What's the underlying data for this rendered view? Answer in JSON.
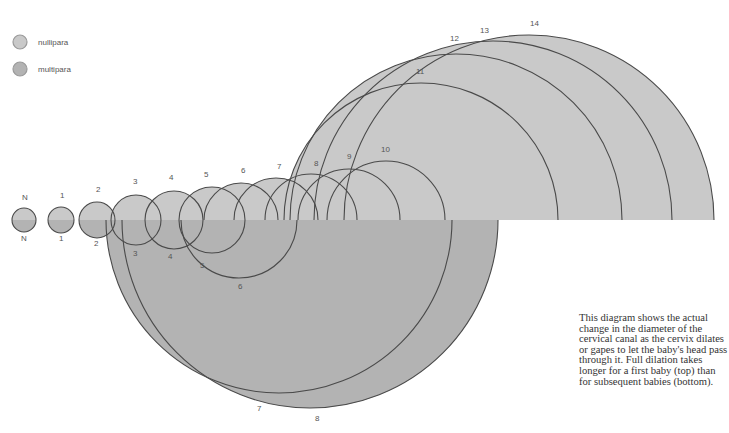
{
  "legend": [
    {
      "label": "nullipara",
      "color": "#c9c9c9",
      "cx": 20,
      "cy": 42
    },
    {
      "label": "multipara",
      "color": "#b3b3b3",
      "cx": 20,
      "cy": 69
    }
  ],
  "caption": "This diagram shows the actual change in the diameter of the cervical canal as the cervix dilates or gapes to let the baby's head pass through it. Full dilation takes longer for a first baby (top) than for subsequent babies (bottom).",
  "colors": {
    "top_fill": "#c9c9c9",
    "bottom_fill": "#b3b3b3",
    "stroke": "#4a4a4a",
    "label": "#555555"
  },
  "chart_data": {
    "type": "diagram",
    "baseline_y": 220,
    "top_series": {
      "name": "nullipara",
      "circles": [
        {
          "label": "N",
          "cx": 24,
          "r": 12,
          "lx": 22,
          "ly": 200
        },
        {
          "label": "1",
          "cx": 61,
          "r": 13,
          "lx": 60,
          "ly": 198
        },
        {
          "label": "2",
          "cx": 97,
          "r": 18,
          "lx": 96,
          "ly": 192
        },
        {
          "label": "3",
          "cx": 136,
          "r": 25,
          "lx": 133,
          "ly": 184
        },
        {
          "label": "4",
          "cx": 174,
          "r": 29,
          "lx": 169,
          "ly": 180
        },
        {
          "label": "5",
          "cx": 212,
          "r": 33,
          "lx": 204,
          "ly": 177
        },
        {
          "label": "6",
          "cx": 241,
          "r": 37,
          "lx": 241,
          "ly": 173
        },
        {
          "label": "7",
          "cx": 276,
          "r": 42,
          "lx": 277,
          "ly": 169
        },
        {
          "label": "8",
          "cx": 311,
          "r": 46,
          "lx": 314,
          "ly": 166
        },
        {
          "label": "9",
          "cx": 349,
          "r": 51,
          "lx": 347,
          "ly": 159
        },
        {
          "label": "10",
          "cx": 386,
          "r": 59,
          "lx": 381,
          "ly": 152
        },
        {
          "label": "11",
          "cx": 421,
          "r": 137,
          "lx": 416,
          "ly": 74
        },
        {
          "label": "12",
          "cx": 456,
          "r": 166,
          "lx": 450,
          "ly": 41
        },
        {
          "label": "13",
          "cx": 493,
          "r": 179,
          "lx": 480,
          "ly": 33
        },
        {
          "label": "14",
          "cx": 529,
          "r": 185,
          "lx": 530,
          "ly": 26
        }
      ]
    },
    "bottom_series": {
      "name": "multipara",
      "circles": [
        {
          "label": "N",
          "cx": 24,
          "r": 12,
          "lx": 21,
          "ly": 241
        },
        {
          "label": "1",
          "cx": 61,
          "r": 13,
          "lx": 59,
          "ly": 241
        },
        {
          "label": "2",
          "cx": 97,
          "r": 18,
          "lx": 94,
          "ly": 246
        },
        {
          "label": "3",
          "cx": 136,
          "r": 25,
          "lx": 133,
          "ly": 256
        },
        {
          "label": "4",
          "cx": 174,
          "r": 29,
          "lx": 168,
          "ly": 259
        },
        {
          "label": "5",
          "cx": 212,
          "r": 33,
          "lx": 200,
          "ly": 268
        },
        {
          "label": "6",
          "cx": 239,
          "r": 58,
          "lx": 238,
          "ly": 289
        },
        {
          "label": "7",
          "cx": 279,
          "r": 173,
          "lx": 257,
          "ly": 411
        },
        {
          "label": "8",
          "cx": 310,
          "r": 188,
          "lx": 315,
          "ly": 421
        }
      ]
    }
  }
}
